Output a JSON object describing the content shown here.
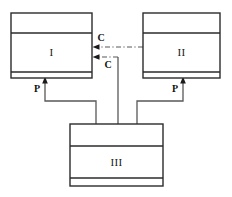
{
  "diagram": {
    "type": "uml-class-diagram",
    "canvas": {
      "width": 232,
      "height": 197,
      "background": "#ffffff"
    },
    "stroke_color": "#2b2b2b",
    "edge_color": "#585858",
    "label_color": "#111111",
    "classes": [
      {
        "id": "class-1",
        "name": "I",
        "compartments": [
          "",
          "I",
          ""
        ],
        "x": 11,
        "y": 13,
        "width": 81,
        "height": 65,
        "divider_y": [
          33,
          72
        ]
      },
      {
        "id": "class-2",
        "name": "II",
        "compartments": [
          "",
          "II",
          ""
        ],
        "x": 143,
        "y": 13,
        "width": 77,
        "height": 65,
        "divider_y": [
          33,
          72
        ]
      },
      {
        "id": "class-3",
        "name": "III",
        "compartments": [
          "",
          "III",
          ""
        ],
        "x": 70,
        "y": 124,
        "width": 93,
        "height": 62,
        "divider_y": [
          146,
          178
        ]
      }
    ],
    "relations": [
      {
        "id": "rel-c-upper",
        "label": "C",
        "style": "dash-dot",
        "arrow": "open-solid-left",
        "from": "class-2",
        "to": "class-1",
        "label_x": 101,
        "label_y": 40
      },
      {
        "id": "rel-c-lower",
        "label": "C",
        "style": "dash-dot",
        "arrow": "open-solid-left",
        "from": "class-3",
        "to": "class-1",
        "label_x": 106,
        "label_y": 65
      },
      {
        "id": "rel-p-left",
        "label": "P",
        "style": "solid",
        "arrow": "solid-up",
        "from": "class-3",
        "to": "class-1",
        "label_x": 44,
        "label_y": 90
      },
      {
        "id": "rel-p-right",
        "label": "P",
        "style": "solid",
        "arrow": "solid-up",
        "from": "class-3",
        "to": "class-2",
        "label_x": 176,
        "label_y": 90
      }
    ],
    "legend": {
      "C": "C",
      "P": "P"
    }
  }
}
